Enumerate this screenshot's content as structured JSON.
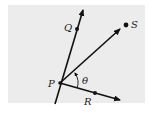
{
  "figure": {
    "background_color": "#ececec",
    "line_color": "#111111",
    "points": {
      "P": {
        "label": "P",
        "x": 60,
        "y": 83
      },
      "Q": {
        "label": "Q",
        "x": 77,
        "y": 29
      },
      "R": {
        "label": "R",
        "x": 95,
        "y": 93
      },
      "S": {
        "label": "S",
        "x": 126,
        "y": 25
      }
    },
    "angle": {
      "label": "θ",
      "between": [
        "PR",
        "PS"
      ]
    },
    "rays": [
      {
        "name": "ray-PQ",
        "from": "P",
        "through": "Q",
        "arrow": true
      },
      {
        "name": "ray-PS",
        "from": "P",
        "toward": "S",
        "arrow": true
      },
      {
        "name": "ray-PR",
        "from": "P",
        "through": "R",
        "arrow": true
      }
    ]
  }
}
